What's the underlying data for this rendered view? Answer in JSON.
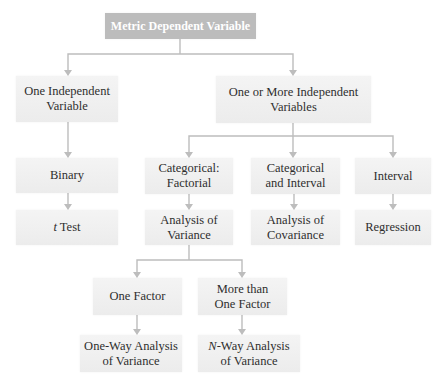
{
  "diagram": {
    "title": "Metric Dependent Variable",
    "colors": {
      "root_fill": "#bcbcbc",
      "node_fill": "#efefef",
      "text": "#2e2e2e",
      "connector": "#bdbdbd"
    },
    "nodes": {
      "root": {
        "label": "Metric Dependent Variable"
      },
      "one_iv": {
        "line1": "One Independent",
        "line2": "Variable"
      },
      "multi_iv": {
        "line1": "One or More Independent",
        "line2": "Variables"
      },
      "binary": {
        "label": "Binary"
      },
      "t_test": {
        "italic": "t",
        "rest": " Test"
      },
      "cat_factorial": {
        "line1": "Categorical:",
        "line2": "Factorial"
      },
      "cat_interval": {
        "line1": "Categorical",
        "line2": "and Interval"
      },
      "interval": {
        "label": "Interval"
      },
      "anova": {
        "line1": "Analysis of",
        "line2": "Variance"
      },
      "ancova": {
        "line1": "Analysis of",
        "line2": "Covariance"
      },
      "regression": {
        "label": "Regression"
      },
      "one_factor": {
        "label": "One Factor"
      },
      "more_factor": {
        "line1": "More than",
        "line2": "One Factor"
      },
      "one_way": {
        "line1": "One-Way Analysis",
        "line2": "of Variance"
      },
      "n_way": {
        "italic": "N",
        "rest": "-Way Analysis",
        "line2": "of Variance"
      }
    },
    "edges": [
      [
        "root",
        "one_iv"
      ],
      [
        "root",
        "multi_iv"
      ],
      [
        "one_iv",
        "binary"
      ],
      [
        "binary",
        "t_test"
      ],
      [
        "multi_iv",
        "cat_factorial"
      ],
      [
        "multi_iv",
        "cat_interval"
      ],
      [
        "multi_iv",
        "interval"
      ],
      [
        "cat_factorial",
        "anova"
      ],
      [
        "cat_interval",
        "ancova"
      ],
      [
        "interval",
        "regression"
      ],
      [
        "anova",
        "one_factor"
      ],
      [
        "anova",
        "more_factor"
      ],
      [
        "one_factor",
        "one_way"
      ],
      [
        "more_factor",
        "n_way"
      ]
    ]
  }
}
